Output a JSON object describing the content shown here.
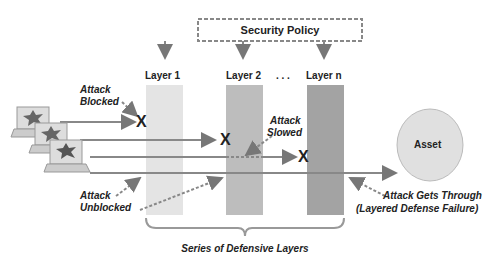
{
  "policy": {
    "label": "Security Policy"
  },
  "layers": [
    {
      "label": "Layer 1",
      "fill": "#e4e4e4"
    },
    {
      "label": "Layer 2",
      "fill": "#bdbdbd"
    },
    {
      "label": "Layer n",
      "fill": "#a3a3a3"
    }
  ],
  "ellipsis": ". . .",
  "asset": {
    "label": "Asset"
  },
  "annotations": {
    "blocked_1": "Attack",
    "blocked_2": "Blocked",
    "slowed_1": "Attack",
    "slowed_2": "Slowed",
    "unblocked_1": "Attack",
    "unblocked_2": "Unblocked",
    "through_1": "Attack Gets Through",
    "through_2": "(Layered Defense Failure)"
  },
  "brace_label": "Series of Defensive Layers",
  "block_mark": "X"
}
